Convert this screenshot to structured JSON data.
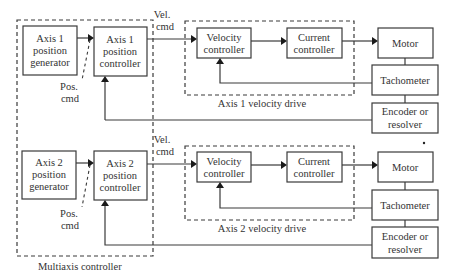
{
  "diagram": {
    "multiaxis_label": "Multiaxis controller",
    "axes": [
      {
        "generator": [
          "Axis 1",
          "position",
          "generator"
        ],
        "controller": [
          "Axis 1",
          "position",
          "controller"
        ],
        "pos_cmd": [
          "Pos.",
          "cmd"
        ],
        "vel_cmd": [
          "Vel.",
          "cmd"
        ],
        "velocity_controller": [
          "Velocity",
          "controller"
        ],
        "current_controller": [
          "Current",
          "controller"
        ],
        "drive_label": "Axis 1 velocity drive",
        "motor": "Motor",
        "tachometer": "Tachometer",
        "encoder": [
          "Encoder or",
          "resolver"
        ]
      },
      {
        "generator": [
          "Axis 2",
          "position",
          "generator"
        ],
        "controller": [
          "Axis 2",
          "position",
          "controller"
        ],
        "pos_cmd": [
          "Pos.",
          "cmd"
        ],
        "vel_cmd": [
          "Vel.",
          "cmd"
        ],
        "velocity_controller": [
          "Velocity",
          "controller"
        ],
        "current_controller": [
          "Current",
          "controller"
        ],
        "drive_label": "Axis 2 velocity drive",
        "motor": "Motor",
        "tachometer": "Tachometer",
        "encoder": [
          "Encoder or",
          "resolver"
        ]
      }
    ]
  }
}
